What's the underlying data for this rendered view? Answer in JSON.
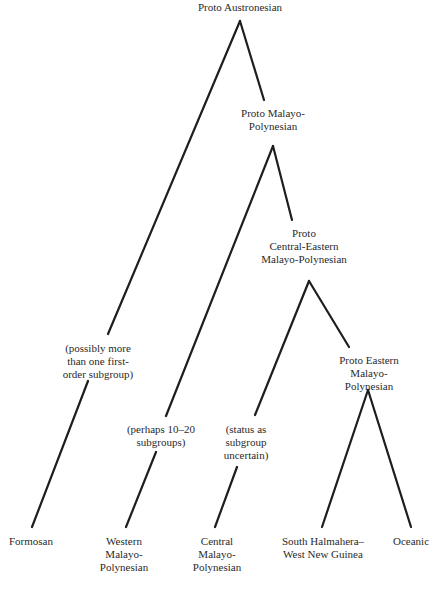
{
  "diagram": {
    "type": "tree",
    "background": "#ffffff",
    "line_color": "#1e1e1e",
    "nodes": [
      {
        "id": "pan",
        "label": "Proto Austronesian"
      },
      {
        "id": "pmp",
        "label": "Proto Malayo-\nPolynesian"
      },
      {
        "id": "pcemp",
        "label": "Proto\nCentral-Eastern\nMalayo-Polynesian"
      },
      {
        "id": "pemp",
        "label": "Proto Eastern\nMalayo-Polynesian"
      }
    ],
    "annotations": [
      {
        "id": "formosan-note",
        "label": "(possibly more\nthan one first-\norder subgroup)"
      },
      {
        "id": "wmp-note",
        "label": "(perhaps 10–20\nsubgroups)"
      },
      {
        "id": "cmp-note",
        "label": "(status as\nsubgroup\nuncertain)"
      }
    ],
    "leaves": [
      {
        "id": "formosan",
        "label": "Formosan"
      },
      {
        "id": "wmp",
        "label": "Western\nMalayo-\nPolynesian"
      },
      {
        "id": "cmp",
        "label": "Central\nMalayo-\nPolynesian"
      },
      {
        "id": "shwng",
        "label": "South Halmahera–\nWest New Guinea"
      },
      {
        "id": "oceanic",
        "label": "Oceanic"
      }
    ],
    "edges": [
      {
        "from": "pan",
        "to": "formosan"
      },
      {
        "from": "pan",
        "to": "pmp"
      },
      {
        "from": "pmp",
        "to": "wmp"
      },
      {
        "from": "pmp",
        "to": "pcemp"
      },
      {
        "from": "pcemp",
        "to": "cmp"
      },
      {
        "from": "pcemp",
        "to": "pemp"
      },
      {
        "from": "pemp",
        "to": "shwng"
      },
      {
        "from": "pemp",
        "to": "oceanic"
      }
    ]
  }
}
